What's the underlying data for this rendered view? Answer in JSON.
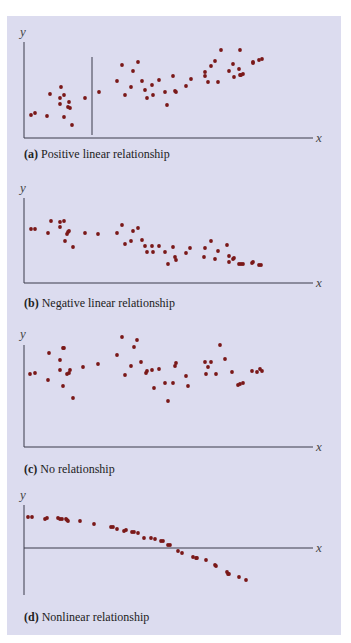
{
  "page": {
    "background": "#ffffff",
    "panel_background": "#dcdcef",
    "dot_color": "#7a1818",
    "axis_color": "#3a3a4a"
  },
  "panels": [
    {
      "id": "a",
      "tag": "(a)",
      "caption": "Positive linear relationship",
      "ylabel": "y",
      "xlabel": "x"
    },
    {
      "id": "b",
      "tag": "(b)",
      "caption": "Negative linear relationship",
      "ylabel": "y",
      "xlabel": "x"
    },
    {
      "id": "c",
      "tag": "(c)",
      "caption": "No relationship",
      "ylabel": "y",
      "xlabel": "x"
    },
    {
      "id": "d",
      "tag": "(d)",
      "caption": "Nonlinear relationship",
      "ylabel": "y",
      "xlabel": "x"
    }
  ],
  "chart_data": [
    {
      "type": "scatter",
      "title": "(a) Positive linear relationship",
      "xlabel": "x",
      "ylabel": "y",
      "grid": false,
      "note": "pixel coordinates in image space; y-axis at x=24, x-axis at y=138; vertical divider line at x=92",
      "points": [
        [
          31,
          115
        ],
        [
          35,
          113
        ],
        [
          47,
          116
        ],
        [
          50,
          94
        ],
        [
          61,
          87
        ],
        [
          60,
          98
        ],
        [
          60,
          104
        ],
        [
          64,
          95
        ],
        [
          69,
          102
        ],
        [
          70,
          108
        ],
        [
          68,
          107
        ],
        [
          64,
          117
        ],
        [
          72,
          125
        ],
        [
          85,
          98
        ],
        [
          99,
          92
        ],
        [
          117,
          81
        ],
        [
          122,
          65
        ],
        [
          125,
          95
        ],
        [
          131,
          87
        ],
        [
          133,
          71
        ],
        [
          138,
          62
        ],
        [
          142,
          81
        ],
        [
          145,
          90
        ],
        [
          147,
          98
        ],
        [
          152,
          85
        ],
        [
          153,
          95
        ],
        [
          159,
          80
        ],
        [
          165,
          92
        ],
        [
          167,
          105
        ],
        [
          173,
          76
        ],
        [
          175,
          91
        ],
        [
          176,
          92
        ],
        [
          186,
          86
        ],
        [
          191,
          79
        ],
        [
          205,
          72
        ],
        [
          205,
          76
        ],
        [
          208,
          82
        ],
        [
          211,
          66
        ],
        [
          215,
          61
        ],
        [
          221,
          50
        ],
        [
          218,
          82
        ],
        [
          229,
          71
        ],
        [
          233,
          64
        ],
        [
          234,
          77
        ],
        [
          239,
          69
        ],
        [
          240,
          50
        ],
        [
          240,
          75
        ],
        [
          241,
          75
        ],
        [
          243,
          74
        ],
        [
          253,
          62
        ],
        [
          253,
          63
        ],
        [
          259,
          60
        ],
        [
          262,
          59
        ]
      ]
    },
    {
      "type": "scatter",
      "title": "(b) Negative linear relationship",
      "xlabel": "x",
      "ylabel": "y",
      "grid": false,
      "note": "pixel coordinates; y-axis at x=24, x-axis at y=283",
      "points": [
        [
          31,
          229
        ],
        [
          35,
          229
        ],
        [
          48,
          233
        ],
        [
          51,
          221
        ],
        [
          60,
          222
        ],
        [
          60,
          227
        ],
        [
          64,
          221
        ],
        [
          67,
          234
        ],
        [
          68,
          232
        ],
        [
          69,
          231
        ],
        [
          65,
          241
        ],
        [
          73,
          247
        ],
        [
          85,
          233
        ],
        [
          98,
          234
        ],
        [
          117,
          233
        ],
        [
          122,
          225
        ],
        [
          125,
          244
        ],
        [
          131,
          241
        ],
        [
          133,
          231
        ],
        [
          138,
          228
        ],
        [
          142,
          240
        ],
        [
          145,
          246
        ],
        [
          147,
          252
        ],
        [
          153,
          252
        ],
        [
          152,
          246
        ],
        [
          159,
          246
        ],
        [
          165,
          252
        ],
        [
          168,
          264
        ],
        [
          173,
          247
        ],
        [
          175,
          257
        ],
        [
          176,
          260
        ],
        [
          186,
          253
        ],
        [
          190,
          248
        ],
        [
          205,
          248
        ],
        [
          204,
          257
        ],
        [
          211,
          241
        ],
        [
          215,
          259
        ],
        [
          218,
          251
        ],
        [
          227,
          245
        ],
        [
          229,
          262
        ],
        [
          229,
          256
        ],
        [
          233,
          259
        ],
        [
          234,
          258
        ],
        [
          239,
          264
        ],
        [
          241,
          264
        ],
        [
          243,
          264
        ],
        [
          252,
          263
        ],
        [
          253,
          262
        ],
        [
          259,
          265
        ],
        [
          261,
          265
        ]
      ]
    },
    {
      "type": "scatter",
      "title": "(c) No relationship",
      "xlabel": "x",
      "ylabel": "y",
      "grid": false,
      "note": "pixel coordinates; y-axis at x=24, x-axis at y=447",
      "points": [
        [
          30,
          374
        ],
        [
          35,
          373
        ],
        [
          48,
          380
        ],
        [
          49,
          353
        ],
        [
          60,
          360
        ],
        [
          63,
          348
        ],
        [
          60,
          370
        ],
        [
          64,
          348
        ],
        [
          67,
          374
        ],
        [
          69,
          373
        ],
        [
          70,
          370
        ],
        [
          63,
          386
        ],
        [
          73,
          398
        ],
        [
          83,
          367
        ],
        [
          98,
          364
        ],
        [
          117,
          355
        ],
        [
          122,
          337
        ],
        [
          125,
          375
        ],
        [
          131,
          366
        ],
        [
          134,
          347
        ],
        [
          137,
          340
        ],
        [
          141,
          362
        ],
        [
          146,
          373
        ],
        [
          147,
          371
        ],
        [
          152,
          370
        ],
        [
          154,
          388
        ],
        [
          159,
          369
        ],
        [
          165,
          383
        ],
        [
          168,
          401
        ],
        [
          173,
          383
        ],
        [
          175,
          366
        ],
        [
          176,
          363
        ],
        [
          186,
          376
        ],
        [
          188,
          386
        ],
        [
          211,
          362
        ],
        [
          206,
          374
        ],
        [
          205,
          362
        ],
        [
          208,
          367
        ],
        [
          216,
          374
        ],
        [
          220,
          345
        ],
        [
          225,
          359
        ],
        [
          232,
          372
        ],
        [
          238,
          385
        ],
        [
          240,
          384
        ],
        [
          243,
          383
        ],
        [
          252,
          371
        ],
        [
          257,
          372
        ],
        [
          260,
          369
        ],
        [
          262,
          371
        ]
      ]
    },
    {
      "type": "scatter",
      "title": "(d) Nonlinear relationship",
      "xlabel": "x",
      "ylabel": "y",
      "grid": false,
      "note": "pixel coordinates; y-axis at x=24 (y 505-595), x-axis at y=548; points follow a concave-down curve",
      "points": [
        [
          28,
          517
        ],
        [
          32,
          517
        ],
        [
          45,
          519
        ],
        [
          47,
          518
        ],
        [
          58,
          518
        ],
        [
          60,
          519
        ],
        [
          62,
          519
        ],
        [
          66,
          519
        ],
        [
          67,
          520
        ],
        [
          68,
          521
        ],
        [
          80,
          521
        ],
        [
          94,
          524
        ],
        [
          111,
          527
        ],
        [
          113,
          527
        ],
        [
          117,
          529
        ],
        [
          124,
          531
        ],
        [
          126,
          530
        ],
        [
          132,
          532
        ],
        [
          134,
          532
        ],
        [
          138,
          533
        ],
        [
          144,
          538
        ],
        [
          151,
          538
        ],
        [
          155,
          539
        ],
        [
          161,
          541
        ],
        [
          163,
          541
        ],
        [
          168,
          545
        ],
        [
          170,
          545
        ],
        [
          178,
          551
        ],
        [
          182,
          553
        ],
        [
          193,
          557
        ],
        [
          196,
          558
        ],
        [
          197,
          558
        ],
        [
          206,
          560
        ],
        [
          215,
          565
        ],
        [
          216,
          566
        ],
        [
          227,
          572
        ],
        [
          228,
          574
        ],
        [
          229,
          574
        ],
        [
          239,
          577
        ],
        [
          246,
          580
        ]
      ]
    }
  ]
}
